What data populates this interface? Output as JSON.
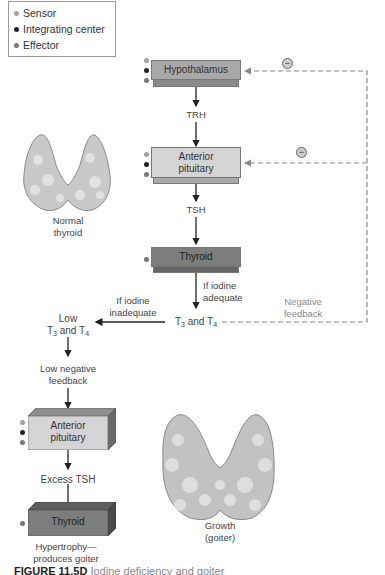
{
  "colors": {
    "sensor": "#a0a0a0",
    "integrating_center": "#222222",
    "effector": "#777777",
    "hypothalamus_box": "#a8a8a8",
    "pituitary_box": "#d4d4d4",
    "thyroid_box": "#7d7d7d",
    "feedback_line": "#888888"
  },
  "legend": {
    "items": [
      {
        "label": "Sensor",
        "color": "#a0a0a0"
      },
      {
        "label": "Integrating center",
        "color": "#222222"
      },
      {
        "label": "Effector",
        "color": "#777777"
      }
    ]
  },
  "main_pathway": {
    "hypothalamus": "Hypothalamus",
    "trh": "TRH",
    "anterior_pituitary_line1": "Anterior",
    "anterior_pituitary_line2": "pituitary",
    "tsh": "TSH",
    "thyroid": "Thyroid",
    "if_iodine_adequate_line1": "If iodine",
    "if_iodine_adequate_line2": "adequate",
    "t3": "T",
    "t3_sub": "3",
    "and": " and T",
    "t4_sub": "4",
    "negative_feedback_line1": "Negative",
    "negative_feedback_line2": "feedback",
    "inhibit_symbol": "−"
  },
  "goiter_pathway": {
    "if_iodine_inadequate_line1": "If iodine",
    "if_iodine_inadequate_line2": "inadequate",
    "low_line1": "Low",
    "low_t": "T",
    "low_t3_sub": "3",
    "low_and": " and T",
    "low_t4_sub": "4",
    "low_negative_feedback_line1": "Low negative",
    "low_negative_feedback_line2": "feedback",
    "anterior_pituitary_line1": "Anterior",
    "anterior_pituitary_line2": "pituitary",
    "excess_tsh": "Excess TSH",
    "thyroid": "Thyroid",
    "hypertrophy_line1": "Hypertrophy—",
    "hypertrophy_line2": "produces goiter"
  },
  "illustrations": {
    "normal_line1": "Normal",
    "normal_line2": "thyroid",
    "goiter_line1": "Growth",
    "goiter_line2": "(goiter)"
  },
  "caption": {
    "label": "FIGURE 11.5D",
    "text": "  Iodine deficiency and goiter"
  }
}
